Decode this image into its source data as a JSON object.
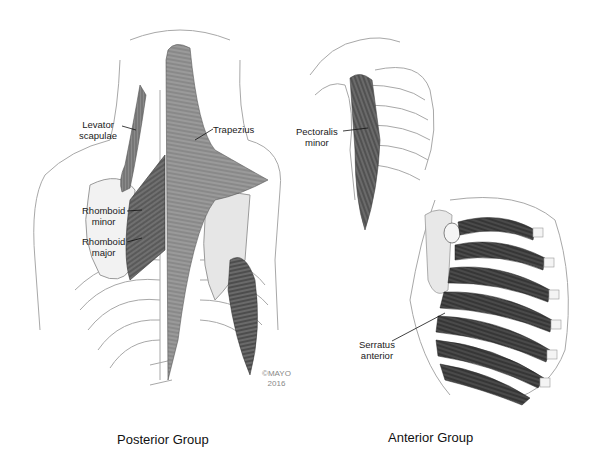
{
  "figure": {
    "panels": [
      {
        "id": "posterior",
        "caption": "Posterior Group",
        "labels": [
          {
            "line1": "Levator",
            "line2": "scapulae"
          },
          {
            "line1": "Trapezius"
          },
          {
            "line1": "Rhomboid",
            "line2": "minor"
          },
          {
            "line1": "Rhomboid",
            "line2": "major"
          }
        ],
        "copyright": {
          "line1": "©MAYO",
          "line2": "2016"
        }
      },
      {
        "id": "anterior",
        "caption": "Anterior Group",
        "labels": [
          {
            "line1": "Pectoralis",
            "line2": "minor"
          },
          {
            "line1": "Serratus",
            "line2": "anterior"
          }
        ]
      }
    ],
    "colors": {
      "outline": "#9a9a9a",
      "muscle_dark": "#4a4a4a",
      "muscle_mid": "#7a7a7a",
      "muscle_light": "#b5b5b5",
      "bone_fill": "#f4f4f4",
      "background": "#ffffff"
    }
  }
}
